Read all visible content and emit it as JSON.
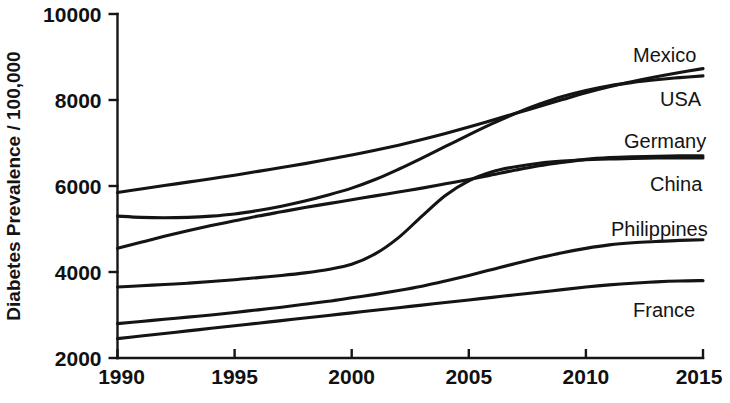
{
  "chart_data": {
    "type": "line",
    "title": "",
    "subtitle": "",
    "xlabel": "",
    "ylabel": "Diabetes Prevalence / 100,000",
    "xlim": [
      1990,
      2015
    ],
    "ylim": [
      2000,
      10000
    ],
    "ytick_values": [
      2000,
      4000,
      6000,
      8000,
      10000
    ],
    "ytick_labels": [
      "2000",
      "4000",
      "6000",
      "8000",
      "10000"
    ],
    "xtick_values": [
      1990,
      1995,
      2000,
      2005,
      2010,
      2015
    ],
    "xtick_labels": [
      "1990",
      "1995",
      "2000",
      "2005",
      "2010",
      "2015"
    ],
    "grid": false,
    "legend_position": "right-inline-labels",
    "line_color": "#141414",
    "x": [
      1990,
      1991,
      1992,
      1993,
      1994,
      1995,
      1996,
      1997,
      1998,
      1999,
      2000,
      2001,
      2002,
      2003,
      2004,
      2005,
      2006,
      2007,
      2008,
      2009,
      2010,
      2011,
      2012,
      2013,
      2014,
      2015
    ],
    "series": [
      {
        "name": "Mexico",
        "label": "Mexico",
        "label_value": 8730,
        "values": [
          5850,
          5930,
          6010,
          6090,
          6170,
          6250,
          6340,
          6430,
          6520,
          6620,
          6720,
          6830,
          6950,
          7080,
          7220,
          7370,
          7530,
          7690,
          7850,
          8010,
          8170,
          8310,
          8430,
          8540,
          8640,
          8730
        ]
      },
      {
        "name": "USA",
        "label": "USA",
        "label_value": 8560,
        "values": [
          5300,
          5270,
          5260,
          5270,
          5300,
          5350,
          5430,
          5530,
          5650,
          5790,
          5950,
          6150,
          6390,
          6650,
          6920,
          7190,
          7450,
          7690,
          7900,
          8080,
          8220,
          8330,
          8410,
          8470,
          8520,
          8560
        ]
      },
      {
        "name": "Germany",
        "label": "Germany",
        "label_value": 6700,
        "values": [
          4550,
          4690,
          4830,
          4960,
          5080,
          5190,
          5300,
          5400,
          5500,
          5590,
          5680,
          5770,
          5860,
          5950,
          6050,
          6150,
          6260,
          6370,
          6470,
          6550,
          6620,
          6660,
          6680,
          6690,
          6700,
          6700
        ]
      },
      {
        "name": "China",
        "label": "China",
        "label_value": 6650,
        "values": [
          3650,
          3680,
          3710,
          3740,
          3780,
          3820,
          3870,
          3920,
          3980,
          4060,
          4180,
          4420,
          4800,
          5300,
          5780,
          6120,
          6330,
          6450,
          6530,
          6580,
          6610,
          6630,
          6640,
          6650,
          6650,
          6650
        ]
      },
      {
        "name": "Philippines",
        "label": "Philippines",
        "label_value": 4750,
        "values": [
          2800,
          2850,
          2900,
          2950,
          3000,
          3060,
          3120,
          3180,
          3250,
          3320,
          3400,
          3480,
          3570,
          3670,
          3790,
          3920,
          4060,
          4200,
          4330,
          4450,
          4550,
          4630,
          4680,
          4710,
          4735,
          4750
        ]
      },
      {
        "name": "France",
        "label": "France",
        "label_value": 3800,
        "values": [
          2450,
          2510,
          2570,
          2630,
          2690,
          2750,
          2810,
          2870,
          2930,
          2990,
          3050,
          3110,
          3170,
          3230,
          3290,
          3350,
          3410,
          3470,
          3530,
          3590,
          3650,
          3700,
          3740,
          3770,
          3790,
          3800
        ]
      }
    ]
  }
}
